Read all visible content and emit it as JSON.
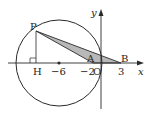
{
  "diagram": {
    "colors": {
      "stroke": "#2a2a2a",
      "shade": "#b8b8b8",
      "background": "#ffffff"
    },
    "axes": {
      "x_label": "x",
      "y_label": "y",
      "origin_label": "O"
    },
    "points": {
      "P": "P",
      "H": "H",
      "A": "A",
      "B": "B"
    },
    "ticks": {
      "minus6": "−6",
      "minus2": "−2",
      "three": "3"
    },
    "shapes": {
      "circle": "circle centered at (−6, 0)",
      "triangle": "shaded triangle PAB",
      "perpendicular": "segment PH perpendicular to x-axis with right-angle mark"
    }
  }
}
